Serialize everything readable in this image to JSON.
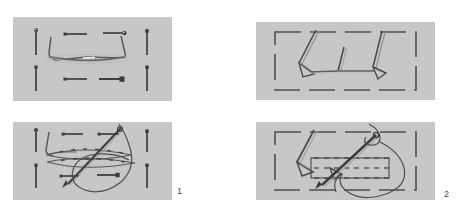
{
  "figure": {
    "background_color": "#ffffff",
    "panel_color": "#c9c9c9",
    "ink_color": "#3a3a3a",
    "thread_color": "#555555",
    "panels": [
      {
        "id": "panel-top-left",
        "step_group": "1",
        "stage": "before",
        "caption": "",
        "x": 13,
        "y": 17,
        "w": 159,
        "h": 84,
        "contents": {
          "pins_left": 2,
          "pins_right": 2,
          "pins_center_horizontal": 4,
          "arch_wire": 1,
          "fabric_edges": 2
        }
      },
      {
        "id": "panel-top-right",
        "step_group": "2",
        "stage": "before",
        "caption": "",
        "x": 256,
        "y": 22,
        "w": 179,
        "h": 78,
        "contents": {
          "dashed_frame": 1,
          "pins_angled": 3,
          "connector_wire": 1
        }
      },
      {
        "id": "panel-bottom-left",
        "step_group": "1",
        "stage": "after",
        "caption": "1",
        "x": 13,
        "y": 122,
        "w": 159,
        "h": 78,
        "contents": {
          "pins_left": 2,
          "pins_right": 2,
          "pins_center_horizontal": 4,
          "needle": 1,
          "thread_loop": 1,
          "running_stitches": 2
        }
      },
      {
        "id": "panel-bottom-right",
        "step_group": "2",
        "stage": "after",
        "caption": "2",
        "x": 256,
        "y": 122,
        "w": 179,
        "h": 78,
        "contents": {
          "dashed_frame": 1,
          "pins_angled": 2,
          "needle": 1,
          "thread_loop": 1,
          "stitched_rows": 3
        }
      }
    ],
    "labels": [
      {
        "id": "label-1",
        "text": "1",
        "x": 177,
        "y": 187
      },
      {
        "id": "label-2",
        "text": "2",
        "x": 444,
        "y": 190
      }
    ]
  }
}
